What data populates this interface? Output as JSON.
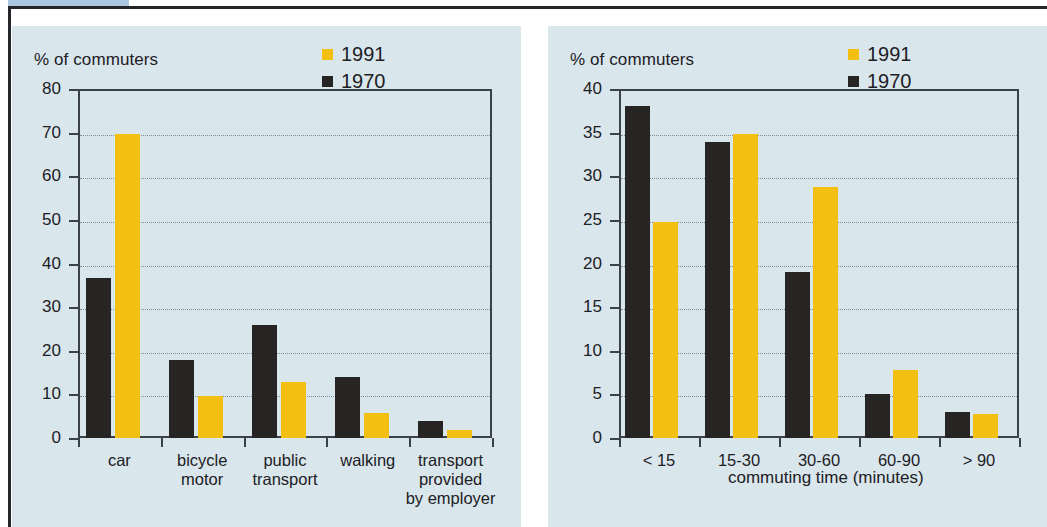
{
  "page": {
    "background_color": "#ffffff",
    "panel_background_color": "#d9e7ed",
    "tab_color": "#a8c6de",
    "rule_color": "#24262a"
  },
  "palette": {
    "series_1991": "#f3c011",
    "series_1970": "#262523",
    "axis": "#3b4148",
    "grid": "#7c8e9c",
    "text": "#1d2024"
  },
  "charts": [
    {
      "id": "mode-of-transport",
      "chart_data": {
        "type": "bar",
        "title": "",
        "ylabel": "% of commuters",
        "xlabel": "",
        "ylim": [
          0,
          80
        ],
        "ytick_labels": [
          "80",
          "70",
          "60",
          "50",
          "40",
          "30",
          "20",
          "10",
          "0"
        ],
        "yticks": [
          80,
          70,
          60,
          50,
          40,
          30,
          20,
          10,
          0
        ],
        "grid": true,
        "legend_position": "top-right",
        "categories": [
          "car",
          "bicycle\nmotor",
          "public\ntransport",
          "walking",
          "transport\nprovided\nby employer"
        ],
        "series": [
          {
            "name": "1970",
            "color": "#262523",
            "values": [
              36.7,
              17.9,
              26.0,
              14.0,
              4.0
            ]
          },
          {
            "name": "1991",
            "color": "#f3c011",
            "values": [
              69.6,
              9.7,
              12.8,
              5.8,
              1.8
            ]
          }
        ]
      }
    },
    {
      "id": "commuting-time",
      "chart_data": {
        "type": "bar",
        "title": "",
        "ylabel": "% of commuters",
        "xlabel": "commuting time (minutes)",
        "ylim": [
          0,
          40
        ],
        "ytick_labels": [
          "40",
          "35",
          "30",
          "25",
          "20",
          "15",
          "10",
          "5",
          "0"
        ],
        "yticks": [
          40,
          35,
          30,
          25,
          20,
          15,
          10,
          5,
          0
        ],
        "grid": true,
        "legend_position": "top-right",
        "categories": [
          "< 15",
          "15-30",
          "30-60",
          "60-90",
          "> 90"
        ],
        "series": [
          {
            "name": "1970",
            "color": "#262523",
            "values": [
              38.0,
              33.9,
              19.0,
              5.0,
              3.0
            ]
          },
          {
            "name": "1991",
            "color": "#f3c011",
            "values": [
              24.8,
              34.8,
              28.8,
              7.8,
              2.8
            ]
          }
        ]
      }
    }
  ]
}
